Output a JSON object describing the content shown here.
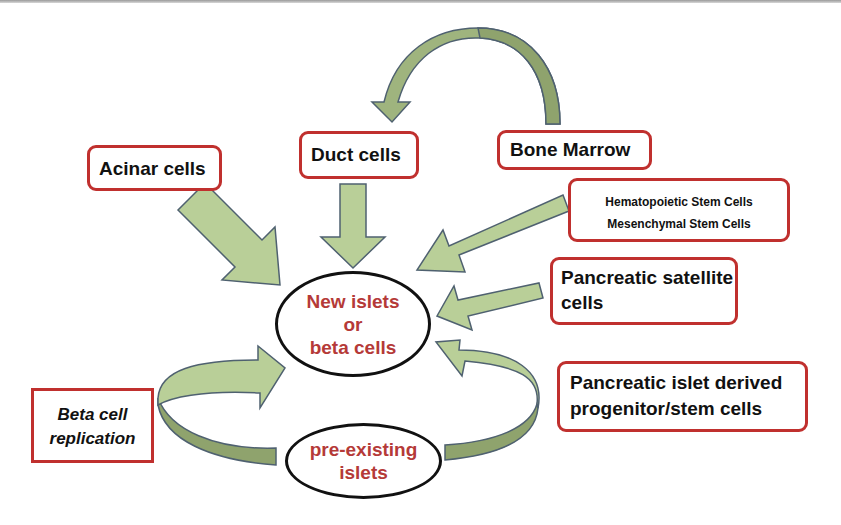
{
  "diagram": {
    "center_node": {
      "lines": [
        "New islets",
        "or",
        "beta cells"
      ]
    },
    "bottom_node": {
      "lines": [
        "pre-existing",
        "islets"
      ]
    },
    "sources": {
      "acinar": {
        "label": "Acinar cells"
      },
      "duct": {
        "label": "Duct cells"
      },
      "bone_marrow": {
        "label": "Bone Marrow"
      },
      "stem_cells": {
        "lines": [
          "Hematopoietic Stem Cells",
          "Mesenchymal Stem Cells"
        ]
      },
      "satellite": {
        "lines": [
          "Pancreatic satellite",
          "cells"
        ]
      },
      "islet_progenitor": {
        "lines": [
          "Pancreatic islet derived",
          "progenitor/stem cells"
        ]
      },
      "replication": {
        "lines": [
          "Beta cell",
          "replication"
        ]
      }
    },
    "edges": [
      {
        "from": "Bone Marrow",
        "to": "Duct cells"
      },
      {
        "from": "Acinar cells",
        "to": "New islets or beta cells"
      },
      {
        "from": "Duct cells",
        "to": "New islets or beta cells"
      },
      {
        "from": "Hematopoietic/Mesenchymal Stem Cells",
        "to": "New islets or beta cells"
      },
      {
        "from": "Pancreatic satellite cells",
        "to": "New islets or beta cells"
      },
      {
        "from": "pre-existing islets",
        "to": "New islets or beta cells",
        "via": "Beta cell replication"
      },
      {
        "from": "pre-existing islets",
        "to": "New islets or beta cells",
        "via": "Pancreatic islet derived progenitor/stem cells"
      }
    ],
    "colors": {
      "box_border": "#c0302e",
      "arrow_fill_light": "#b9cf98",
      "arrow_fill_dark": "#8fa36d",
      "arrow_stroke": "#4f6170",
      "ellipse_text": "#b53a38"
    }
  }
}
